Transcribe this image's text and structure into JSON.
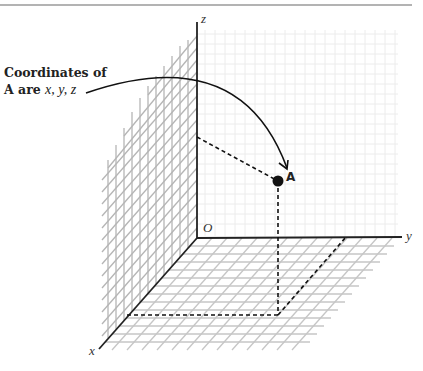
{
  "diagram": {
    "callout": {
      "line1": "Coordinates of",
      "line2_prefix": "A are ",
      "line2_coords": "x, y, z"
    },
    "axes": {
      "x_label": "x",
      "y_label": "y",
      "z_label": "z",
      "origin_label": "O"
    },
    "point": {
      "label": "A",
      "color": "#111111"
    },
    "colors": {
      "axis": "#222222",
      "wall_grid": "#b8b8b8",
      "floor_grid": "#c8c8c8",
      "back_grid": "#ececec",
      "top_rule": "#9a9a9a"
    }
  }
}
